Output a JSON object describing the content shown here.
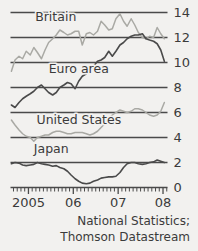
{
  "chart_data": {
    "type": "line",
    "title": "",
    "subtitle": "",
    "xlabel": "",
    "ylabel": "",
    "grid": true,
    "legend_position": "inline-labels",
    "ylim": [
      0,
      14
    ],
    "yticks": [
      0,
      2,
      4,
      6,
      8,
      10,
      12,
      14
    ],
    "ytick_labels": [
      "0",
      "2",
      "4",
      "6",
      "8",
      "10",
      "12",
      "14"
    ],
    "xlim": [
      2004.6,
      2008.1
    ],
    "xticks": [
      2005,
      2006,
      2007,
      2008
    ],
    "xtick_labels": [
      "2005",
      "06",
      "07",
      "08"
    ],
    "x_minor_ticks_per_year": 12,
    "colors": {
      "britain": "#a9a9a4",
      "euro_area": "#4a4a4a",
      "united_states": "#a9a9a4",
      "japan": "#4a4a4a",
      "grid": "#4a4a4a",
      "background": "#f2f1ef",
      "text": "#3b3b3b"
    },
    "series": [
      {
        "name": "Britain",
        "color_key": "britain",
        "label_x": 2005.15,
        "label_y": 13.3,
        "x": [
          2004.62,
          2004.7,
          2004.79,
          2004.87,
          2004.95,
          2005.04,
          2005.12,
          2005.2,
          2005.29,
          2005.37,
          2005.45,
          2005.54,
          2005.62,
          2005.7,
          2005.79,
          2005.87,
          2005.95,
          2006.04,
          2006.12,
          2006.2,
          2006.29,
          2006.37,
          2006.45,
          2006.54,
          2006.62,
          2006.7,
          2006.79,
          2006.87,
          2006.95,
          2007.04,
          2007.12,
          2007.2,
          2007.29,
          2007.37,
          2007.45,
          2007.54,
          2007.62,
          2007.7,
          2007.79,
          2007.87,
          2007.95,
          2008.03
        ],
        "y": [
          9.3,
          10.2,
          10.5,
          10.3,
          10.9,
          10.6,
          11.2,
          10.8,
          10.3,
          11.0,
          11.6,
          11.9,
          12.2,
          12.6,
          12.4,
          12.2,
          12.3,
          12.5,
          12.5,
          11.4,
          12.3,
          12.4,
          12.2,
          12.5,
          13.3,
          13.0,
          12.6,
          12.7,
          13.5,
          13.9,
          13.3,
          12.9,
          13.5,
          13.0,
          12.4,
          12.0,
          11.9,
          12.1,
          12.0,
          12.8,
          12.3,
          11.9
        ]
      },
      {
        "name": "Euro area",
        "color_key": "euro_area",
        "label_x": 2005.45,
        "label_y": 9.2,
        "x": [
          2004.62,
          2004.7,
          2004.79,
          2004.87,
          2004.95,
          2005.04,
          2005.12,
          2005.2,
          2005.29,
          2005.37,
          2005.45,
          2005.54,
          2005.62,
          2005.7,
          2005.79,
          2005.87,
          2005.95,
          2006.04,
          2006.12,
          2006.2,
          2006.29,
          2006.37,
          2006.45,
          2006.54,
          2006.62,
          2006.7,
          2006.79,
          2006.87,
          2006.95,
          2007.04,
          2007.12,
          2007.2,
          2007.29,
          2007.37,
          2007.45,
          2007.54,
          2007.62,
          2007.7,
          2007.79,
          2007.87,
          2007.95,
          2008.03
        ],
        "y": [
          6.6,
          6.4,
          6.8,
          7.1,
          7.3,
          7.5,
          7.7,
          8.0,
          8.2,
          7.9,
          7.6,
          7.4,
          7.6,
          8.0,
          8.2,
          8.4,
          8.3,
          7.9,
          8.5,
          8.9,
          9.1,
          9.4,
          9.7,
          10.1,
          10.2,
          10.4,
          10.9,
          10.5,
          10.9,
          11.4,
          11.6,
          11.9,
          12.1,
          12.2,
          12.2,
          12.3,
          11.9,
          11.8,
          11.7,
          11.5,
          11.0,
          10.1
        ]
      },
      {
        "name": "United States",
        "color_key": "united_states",
        "label_x": 2005.18,
        "label_y": 5.1,
        "x": [
          2004.62,
          2004.7,
          2004.79,
          2004.87,
          2004.95,
          2005.04,
          2005.12,
          2005.2,
          2005.29,
          2005.37,
          2005.45,
          2005.54,
          2005.62,
          2005.7,
          2005.79,
          2005.87,
          2005.95,
          2006.04,
          2006.12,
          2006.2,
          2006.29,
          2006.37,
          2006.45,
          2006.54,
          2006.62,
          2006.7,
          2006.79,
          2006.87,
          2006.95,
          2007.04,
          2007.12,
          2007.2,
          2007.29,
          2007.37,
          2007.45,
          2007.54,
          2007.62,
          2007.7,
          2007.79,
          2007.87,
          2007.95,
          2008.03
        ],
        "y": [
          5.4,
          5.0,
          4.6,
          4.3,
          4.1,
          4.0,
          3.7,
          4.0,
          4.1,
          4.2,
          4.2,
          4.4,
          4.5,
          4.5,
          4.4,
          4.3,
          4.3,
          4.4,
          4.4,
          4.4,
          4.3,
          4.2,
          4.3,
          4.5,
          4.8,
          5.1,
          5.5,
          5.8,
          6.0,
          6.2,
          6.1,
          6.0,
          6.1,
          6.3,
          6.3,
          6.2,
          6.0,
          5.8,
          5.7,
          5.8,
          6.1,
          6.8
        ]
      },
      {
        "name": "Japan",
        "color_key": "japan",
        "label_x": 2005.12,
        "label_y": 2.8,
        "x": [
          2004.62,
          2004.7,
          2004.79,
          2004.87,
          2004.95,
          2005.04,
          2005.12,
          2005.2,
          2005.29,
          2005.37,
          2005.45,
          2005.54,
          2005.62,
          2005.7,
          2005.79,
          2005.87,
          2005.95,
          2006.04,
          2006.12,
          2006.2,
          2006.29,
          2006.37,
          2006.45,
          2006.54,
          2006.62,
          2006.7,
          2006.79,
          2006.87,
          2006.95,
          2007.04,
          2007.12,
          2007.2,
          2007.29,
          2007.37,
          2007.45,
          2007.54,
          2007.62,
          2007.7,
          2007.79,
          2007.87,
          2007.95,
          2008.03
        ],
        "y": [
          1.9,
          2.0,
          1.95,
          1.8,
          1.75,
          1.8,
          1.85,
          2.0,
          1.9,
          1.85,
          1.8,
          1.7,
          1.75,
          1.6,
          1.5,
          1.3,
          1.0,
          0.7,
          0.5,
          0.35,
          0.3,
          0.35,
          0.5,
          0.6,
          0.75,
          0.8,
          0.85,
          0.85,
          0.9,
          1.2,
          1.6,
          1.9,
          2.0,
          2.0,
          1.9,
          1.85,
          1.9,
          2.0,
          2.05,
          2.2,
          2.1,
          2.0
        ]
      }
    ],
    "source": {
      "line1": "National Statistics;",
      "line2": "Thomson Datastream"
    }
  }
}
